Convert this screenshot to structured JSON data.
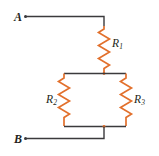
{
  "figure": {
    "type": "circuit-diagram",
    "colors": {
      "wire": "#3b3a3c",
      "resistor": "#e2702c",
      "label": "#231f20",
      "background": "#ffffff"
    }
  },
  "terminals": [
    {
      "id": "A",
      "label": "A",
      "position": "top-left"
    },
    {
      "id": "B",
      "label": "B",
      "position": "bottom-left"
    }
  ],
  "components": [
    {
      "id": "R1",
      "label": "R",
      "subscript": "1",
      "kind": "resistor",
      "orientation": "vertical",
      "connection": "series"
    },
    {
      "id": "R2",
      "label": "R",
      "subscript": "2",
      "kind": "resistor",
      "orientation": "vertical",
      "connection": "parallel"
    },
    {
      "id": "R3",
      "label": "R",
      "subscript": "3",
      "kind": "resistor",
      "orientation": "vertical",
      "connection": "parallel"
    }
  ]
}
